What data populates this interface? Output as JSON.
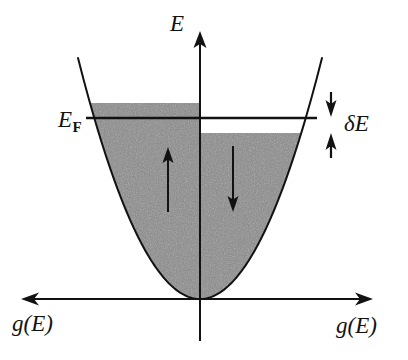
{
  "figure": {
    "background_color": "#ffffff",
    "ink_color": "#121212",
    "fill_color": "#8a8a8a"
  },
  "axes": {
    "vertical": {
      "name": "energy-axis",
      "label": "E",
      "orientation": "vertical",
      "arrow": "up",
      "x": 200,
      "y_top": 33,
      "y_bottom": 341
    },
    "horizontal": {
      "name": "dos-axis",
      "orientation": "horizontal",
      "arrow": "both",
      "y": 299,
      "x_left": 22,
      "x_right": 372,
      "label_left": "g(E)",
      "label_right": "g(E)"
    }
  },
  "labels": {
    "energy": "E",
    "fermi_base": "E",
    "fermi_sub": "F",
    "fermi_full": "E_F",
    "delta_energy": "δE",
    "dos_left": "g(E)",
    "dos_right": "g(E)"
  },
  "bands": {
    "spin_up": {
      "name": "spin-up-band",
      "side": "left",
      "arrow_direction": "up",
      "fill_top_y": 103,
      "arrow_x": 168,
      "arrow_y_top": 150,
      "arrow_y_bottom": 212
    },
    "spin_down": {
      "name": "spin-down-band",
      "side": "right",
      "arrow_direction": "down",
      "fill_top_y": 133,
      "arrow_x": 233,
      "arrow_y_top": 146,
      "arrow_y_bottom": 212
    }
  },
  "fermi_level": {
    "name": "fermi-level-line",
    "y": 118,
    "x_left": 86,
    "x_right": 317
  },
  "delta_marker": {
    "name": "delta-energy-marker",
    "x": 331,
    "y_top": 92,
    "y_bottom": 148,
    "label": "δE"
  },
  "parabola": {
    "vertex_x": 200,
    "vertex_y": 299,
    "left_top_x": 78,
    "right_top_x": 322,
    "top_y": 58,
    "half_width_at_top": 122
  },
  "chart_data": {
    "type": "area",
    "xlabel": "g(E)",
    "ylabel": "E",
    "grid": false,
    "legend": "none",
    "series": [
      {
        "name": "spin-up",
        "side": "left",
        "arrow": "up",
        "filled_to": "E_F + δE",
        "fill_top_energy_px": 103
      },
      {
        "name": "spin-down",
        "side": "right",
        "arrow": "down",
        "filled_to": "E_F - δE",
        "fill_top_energy_px": 133
      }
    ],
    "annotations": [
      {
        "text": "E",
        "role": "axis-label",
        "x": 180,
        "y": 25
      },
      {
        "text": "E_F",
        "role": "fermi-level-label",
        "x": 75,
        "y": 122
      },
      {
        "text": "δE",
        "role": "energy-split-label",
        "x": 360,
        "y": 125
      },
      {
        "text": "g(E)",
        "role": "axis-label-left",
        "x": 40,
        "y": 327
      },
      {
        "text": "g(E)",
        "role": "axis-label-right",
        "x": 365,
        "y": 327
      }
    ]
  }
}
